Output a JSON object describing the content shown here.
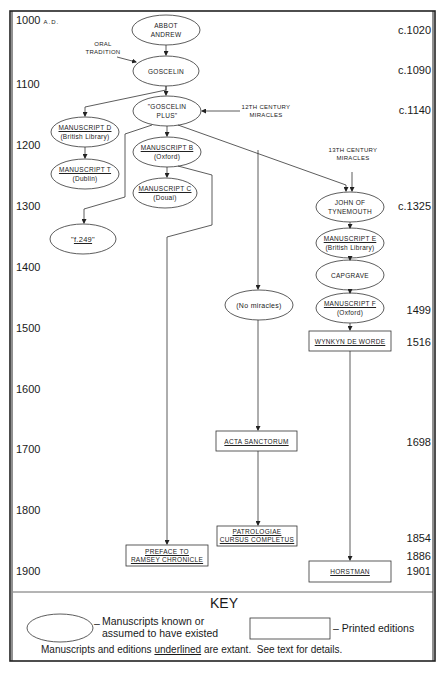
{
  "timeline": {
    "years": [
      {
        "label": "1000",
        "suffix": "A.D.",
        "y": 14
      },
      {
        "label": "1100",
        "y": 83
      },
      {
        "label": "1200",
        "y": 144
      },
      {
        "label": "1300",
        "y": 206
      },
      {
        "label": "1400",
        "y": 266
      },
      {
        "label": "1500",
        "y": 326
      },
      {
        "label": "1600",
        "y": 387
      },
      {
        "label": "1700",
        "y": 447
      },
      {
        "label": "1800",
        "y": 508
      },
      {
        "label": "1900",
        "y": 569
      }
    ],
    "dates": [
      {
        "label": "c.1020",
        "y": 22
      },
      {
        "label": "c.1090",
        "y": 62
      },
      {
        "label": "c.1140",
        "y": 103
      },
      {
        "label": "c.1325",
        "y": 205
      },
      {
        "label": "1499",
        "y": 305
      },
      {
        "label": "1516",
        "y": 336
      },
      {
        "label": "1698",
        "y": 441
      },
      {
        "label": "1854",
        "y": 539
      },
      {
        "label": "1886",
        "y": 557
      },
      {
        "label": "1901",
        "y": 570
      }
    ]
  },
  "nodes": {
    "abbot_andrew": {
      "line1": "ABBOT",
      "line2": "ANDREW"
    },
    "goscelin": {
      "line1": "GOSCELIN"
    },
    "goscelin_plus": {
      "line1": "\"GOSCELIN",
      "line2": "PLUS\""
    },
    "ms_d": {
      "line1": "MANUSCRIPT D",
      "line2": "(British Library)"
    },
    "ms_t": {
      "line1": "MANUSCRIPT T",
      "line2": "(Dublin)"
    },
    "ms_b": {
      "line1": "MANUSCRIPT B",
      "line2": "(Oxford)"
    },
    "ms_c": {
      "line1": "MANUSCRIPT C",
      "line2": "(Douai)"
    },
    "f249": {
      "pre": "\"",
      "line1": "f.249",
      "post": "\""
    },
    "john_tynemouth": {
      "line1": "JOHN OF",
      "line2": "TYNEMOUTH"
    },
    "ms_e": {
      "line1": "MANUSCRIPT E",
      "line2": "(British Library)"
    },
    "capgrave": {
      "line1": "CAPGRAVE"
    },
    "ms_f": {
      "line1": "MANUSCRIPT F",
      "line2": "(Oxford)"
    },
    "no_miracles": {
      "line1": "(No miracles)"
    },
    "wynkyn": {
      "line1": "WYNKYN DE WORDE"
    },
    "acta": {
      "line1": "ACTA SANCTORUM"
    },
    "patrologiae": {
      "line1": "PATROLOGIAE",
      "line2": "CURSUS COMPLETUS"
    },
    "preface": {
      "line1": "PREFACE TO",
      "line2": "RAMSEY CHRONICLE"
    },
    "horstman": {
      "line1": "HORSTMAN"
    }
  },
  "notes": {
    "oral_tradition": {
      "line1": "ORAL",
      "line2": "TRADITION"
    },
    "miracles_12th": {
      "line1": "12TH CENTURY",
      "line2": "MIRACLES"
    },
    "miracles_13th": {
      "line1": "13TH CENTURY",
      "line2": "MIRACLES"
    }
  },
  "key": {
    "title": "KEY",
    "ellipse_desc_line1": "Manuscripts known or",
    "ellipse_desc_line2": "assumed to have existed",
    "box_desc": "Printed editions",
    "footer_pre": "Manuscripts and editions ",
    "footer_underlined": "underlined",
    "footer_post": " are extant.  See text for details."
  },
  "colors": {
    "ink": "#1a1a1a",
    "paper": "#ffffff",
    "line": "#333333"
  }
}
